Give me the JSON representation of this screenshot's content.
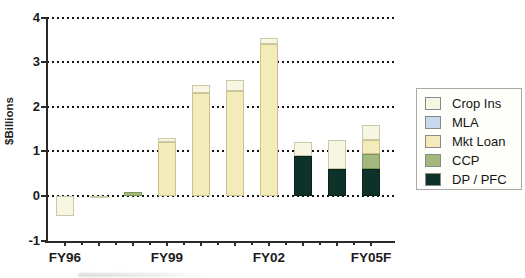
{
  "chart_data": {
    "type": "bar",
    "stacked": true,
    "title": "",
    "ylabel": "$Billions",
    "xlabel": "",
    "ylim": [
      -1,
      4
    ],
    "yticks": [
      -1,
      0,
      1,
      2,
      3,
      4
    ],
    "grid": "dotted-horizontal",
    "legend_position": "right",
    "x_labeled_ticks": [
      "FY96",
      "FY99",
      "FY02",
      "FY05F"
    ],
    "categories": [
      "FY96",
      "FY97",
      "FY98",
      "FY99",
      "FY00",
      "FY01",
      "FY02",
      "FY03",
      "FY04",
      "FY05F"
    ],
    "label_indices": [
      0,
      3,
      6,
      9
    ],
    "bars": [
      {
        "label": "FY96",
        "segments": [
          {
            "key": "crop_ins",
            "value": -0.45
          }
        ]
      },
      {
        "label": "FY97",
        "segments": [
          {
            "key": "crop_ins",
            "value": -0.05
          }
        ]
      },
      {
        "label": "FY98",
        "segments": [
          {
            "key": "ccp",
            "value": 0.08
          }
        ]
      },
      {
        "label": "FY99",
        "segments": [
          {
            "key": "mkt_loan",
            "value": 1.2
          },
          {
            "key": "crop_ins",
            "value": 0.1
          }
        ]
      },
      {
        "label": "FY00",
        "segments": [
          {
            "key": "mkt_loan",
            "value": 2.3
          },
          {
            "key": "crop_ins",
            "value": 0.2
          }
        ]
      },
      {
        "label": "FY01",
        "segments": [
          {
            "key": "mkt_loan",
            "value": 2.35
          },
          {
            "key": "crop_ins",
            "value": 0.25
          }
        ]
      },
      {
        "label": "FY02",
        "segments": [
          {
            "key": "mkt_loan",
            "value": 3.4
          },
          {
            "key": "crop_ins",
            "value": 0.15
          }
        ]
      },
      {
        "label": "FY03",
        "segments": [
          {
            "key": "dp_pfc",
            "value": 0.9
          },
          {
            "key": "crop_ins",
            "value": 0.3
          }
        ]
      },
      {
        "label": "FY04",
        "segments": [
          {
            "key": "dp_pfc",
            "value": 0.6
          },
          {
            "key": "crop_ins",
            "value": 0.65
          }
        ]
      },
      {
        "label": "FY05F",
        "segments": [
          {
            "key": "dp_pfc",
            "value": 0.6
          },
          {
            "key": "ccp",
            "value": 0.35
          },
          {
            "key": "mkt_loan",
            "value": 0.3
          },
          {
            "key": "crop_ins",
            "value": 0.35
          }
        ]
      }
    ],
    "legend": [
      {
        "key": "crop_ins",
        "label": "Crop Ins"
      },
      {
        "key": "mla",
        "label": "MLA"
      },
      {
        "key": "mkt_loan",
        "label": "Mkt Loan"
      },
      {
        "key": "ccp",
        "label": "CCP"
      },
      {
        "key": "dp_pfc",
        "label": "DP / PFC"
      }
    ],
    "colors": {
      "crop_ins": "#f7f6e3",
      "mla": "#c7d9ef",
      "mkt_loan": "#f3ebba",
      "ccp": "#a2b87d",
      "dp_pfc": "#0e3129"
    },
    "border_colors": {
      "crop_ins": "#ccc9a8",
      "mla": "#9fb6d4",
      "mkt_loan": "#cdc28b",
      "ccp": "#7c985c",
      "dp_pfc": "#09231d"
    }
  }
}
